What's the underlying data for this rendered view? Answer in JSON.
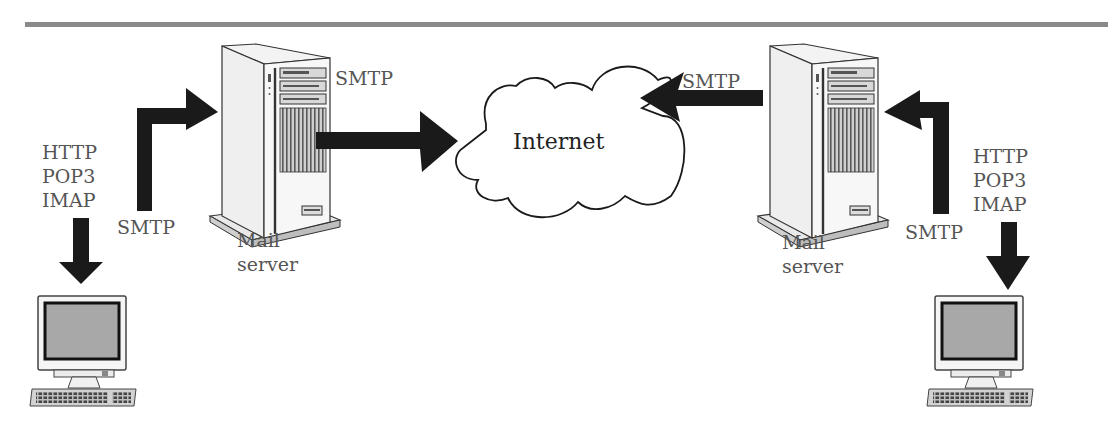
{
  "diagram": {
    "cloud_label": "Internet",
    "left": {
      "server_label": [
        "Mail",
        "server"
      ],
      "client_protocols": [
        "HTTP",
        "POP3",
        "IMAP"
      ],
      "client_to_server_protocol": "SMTP",
      "server_to_internet_protocol": "SMTP"
    },
    "right": {
      "server_label": [
        "Mail",
        "server"
      ],
      "client_protocols": [
        "HTTP",
        "POP3",
        "IMAP"
      ],
      "client_to_server_protocol": "SMTP",
      "server_to_internet_protocol": "SMTP"
    },
    "colors": {
      "arrow": "#1a1a1a",
      "text": "#555555",
      "rule": "#8a8a8a",
      "screen": "#a8a8a8"
    }
  }
}
